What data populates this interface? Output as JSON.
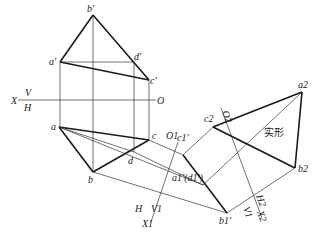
{
  "diagram": {
    "type": "descriptive-geometry-auxiliary-projection",
    "axes": {
      "x_axis": {
        "left_label": "X",
        "upper_label": "V",
        "lower_label": "H",
        "origin_label": "O"
      },
      "x1_axis": {
        "origin_label": "O1",
        "left_label": "H",
        "right_label": "V1",
        "end_label": "X1"
      },
      "x2_axis": {
        "origin_label": "O2",
        "upper_label": "H2",
        "lower_label": "V1",
        "end_label": "X2"
      }
    },
    "front_view_labels": {
      "b": "b'",
      "a": "a'",
      "d": "d'",
      "c": "c'"
    },
    "top_view_labels": {
      "a": "a",
      "b": "b",
      "c": "c",
      "d": "d"
    },
    "aux1_labels": {
      "c": "c1'",
      "ad": "a1'(d1')",
      "b": "b1'"
    },
    "aux2_labels": {
      "a": "a2",
      "b": "b2",
      "c": "c2"
    },
    "true_shape_label": "实形"
  }
}
